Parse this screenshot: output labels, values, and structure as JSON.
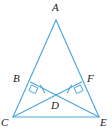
{
  "figure": {
    "kind": "geometry-diagram",
    "width": 112,
    "height": 140,
    "background_color": "#ffffff",
    "line_color": "#4da6dd",
    "label_color": "#1a1a1a",
    "line_width": 1.1
  },
  "points": [
    {
      "name": "A",
      "label": "A",
      "x": 56,
      "y": 20,
      "label_x": 52,
      "label_y": 2,
      "role": "apex-vertex"
    },
    {
      "name": "B",
      "label": "B",
      "x": 30.5,
      "y": 82,
      "label_x": 13,
      "label_y": 73,
      "role": "point-on-side-AC"
    },
    {
      "name": "C",
      "label": "C",
      "x": 13,
      "y": 117,
      "label_x": 1,
      "label_y": 117,
      "role": "base-vertex-left"
    },
    {
      "name": "D",
      "label": "D",
      "x": 56,
      "y": 96.5,
      "label_x": 51,
      "label_y": 100,
      "role": "intersection-of-cevians"
    },
    {
      "name": "E",
      "label": "E",
      "x": 99,
      "y": 117,
      "label_x": 100,
      "label_y": 117,
      "role": "base-vertex-right"
    },
    {
      "name": "F",
      "label": "F",
      "x": 81.5,
      "y": 82,
      "label_x": 87,
      "label_y": 73,
      "role": "point-on-side-AE"
    }
  ],
  "segments": [
    {
      "name": "segment-AC",
      "from": "A",
      "to": "C",
      "label": "AC"
    },
    {
      "name": "segment-AE",
      "from": "A",
      "to": "E",
      "label": "AE"
    },
    {
      "name": "segment-CE",
      "from": "C",
      "to": "E",
      "label": "CE"
    },
    {
      "name": "cevian-CF",
      "from": "C",
      "to": "F",
      "label": "CF"
    },
    {
      "name": "cevian-EB",
      "from": "E",
      "to": "B",
      "label": "EB"
    }
  ],
  "marks": {
    "right_angles": [
      {
        "name": "right-angle-at-B",
        "vertex": "B",
        "size": 7,
        "label": "right angle at B"
      },
      {
        "name": "right-angle-at-F",
        "vertex": "F",
        "size": 7,
        "label": "right angle at F"
      }
    ],
    "congruence_ticks": [
      {
        "name": "tick-on-BD",
        "segment": "BD",
        "count": 1,
        "label": "single tick"
      },
      {
        "name": "tick-on-FD",
        "segment": "FD",
        "count": 1,
        "label": "single tick"
      }
    ]
  }
}
